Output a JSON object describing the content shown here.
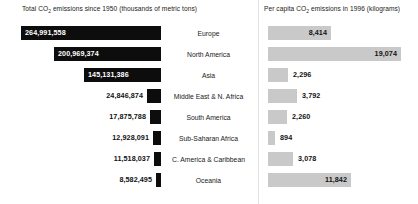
{
  "headers": {
    "left_pre": "Total CO",
    "left_sub": "2",
    "left_post": " emissions since 1950 (thousands of metric tons)",
    "right_pre": "Per capita CO",
    "right_sub": "2",
    "right_post": " emissions in 1996 (kilograms)"
  },
  "colors": {
    "total_bar": "#0d0d0d",
    "percapita_bar": "#c9c9c9",
    "background": "#ffffff",
    "divider": "#e2e2e2"
  },
  "chart_data": {
    "type": "bar",
    "orientation": "horizontal",
    "categories": [
      "Europe",
      "North America",
      "Asia",
      "Middle East & N. Africa",
      "South America",
      "Sub-Saharan Africa",
      "C. America & Caribbean",
      "Oceania"
    ],
    "series": [
      {
        "name": "Total CO2 emissions since 1950 (thousands of metric tons)",
        "units": "thousands of metric tons",
        "direction": "left",
        "values": [
          264991558,
          200969374,
          145131386,
          24846874,
          17875788,
          12928091,
          11518037,
          8582495
        ],
        "labels": [
          "264,991,558",
          "200,969,374",
          "145,131,386",
          "24,846,874",
          "17,875,788",
          "12,928,091",
          "11,518,037",
          "8,582,495"
        ]
      },
      {
        "name": "Per capita CO2 emissions in 1996 (kilograms)",
        "units": "kilograms",
        "direction": "right",
        "values": [
          8414,
          19074,
          2296,
          3792,
          2260,
          894,
          3078,
          11842
        ],
        "labels": [
          "8,414",
          "19,074",
          "2,296",
          "3,792",
          "2,260",
          "894",
          "3,078",
          "11,842"
        ]
      }
    ],
    "grid": false,
    "legend": "none",
    "axis_visible": false
  },
  "rows": [
    {
      "region": "Europe",
      "total_label": "264,991,558",
      "total_value": 264991558,
      "total_bar_width": 140,
      "total_label_inside": true,
      "percap_label": "8,414",
      "percap_value": 8414,
      "percap_bar_width": 63,
      "percap_label_inside": true
    },
    {
      "region": "North America",
      "total_label": "200,969,374",
      "total_value": 200969374,
      "total_bar_width": 107,
      "total_label_inside": true,
      "percap_label": "19,074",
      "percap_value": 19074,
      "percap_bar_width": 133,
      "percap_label_inside": true
    },
    {
      "region": "Asia",
      "total_label": "145,131,386",
      "total_value": 145131386,
      "total_bar_width": 77,
      "total_label_inside": true,
      "percap_label": "2,296",
      "percap_value": 2296,
      "percap_bar_width": 20,
      "percap_label_inside": false
    },
    {
      "region": "Middle East & N. Africa",
      "total_label": "24,846,874",
      "total_value": 24846874,
      "total_bar_width": 14,
      "total_label_inside": false,
      "percap_label": "3,792",
      "percap_value": 3792,
      "percap_bar_width": 29,
      "percap_label_inside": false
    },
    {
      "region": "South America",
      "total_label": "17,875,788",
      "total_value": 17875788,
      "total_bar_width": 11,
      "total_label_inside": false,
      "percap_label": "2,260",
      "percap_value": 2260,
      "percap_bar_width": 19,
      "percap_label_inside": false
    },
    {
      "region": "Sub-Saharan Africa",
      "total_label": "12,928,091",
      "total_value": 12928091,
      "total_bar_width": 8,
      "total_label_inside": false,
      "percap_label": "894",
      "percap_value": 894,
      "percap_bar_width": 7,
      "percap_label_inside": false
    },
    {
      "region": "C. America & Caribbean",
      "total_label": "11,518,037",
      "total_value": 11518037,
      "total_bar_width": 7,
      "total_label_inside": false,
      "percap_label": "3,078",
      "percap_value": 3078,
      "percap_bar_width": 25,
      "percap_label_inside": false
    },
    {
      "region": "Oceania",
      "total_label": "8,582,495",
      "total_value": 8582495,
      "total_bar_width": 5,
      "total_label_inside": false,
      "percap_label": "11,842",
      "percap_value": 11842,
      "percap_bar_width": 83,
      "percap_label_inside": true
    }
  ]
}
